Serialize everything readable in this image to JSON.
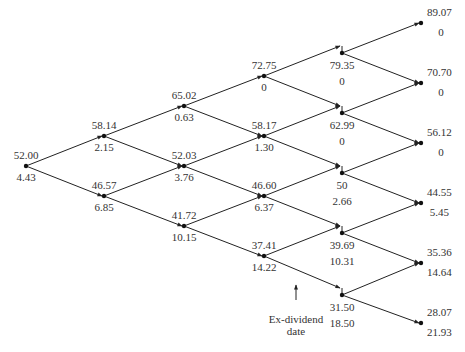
{
  "diagram": {
    "type": "binomial-tree",
    "annotation": {
      "line1": "Ex-dividend",
      "line2": "date"
    },
    "nodes": [
      {
        "id": "A",
        "step": 0,
        "x": 26,
        "y": 166,
        "price": "52.00",
        "option": "4.43"
      },
      {
        "id": "B1",
        "step": 1,
        "x": 104,
        "y": 136,
        "price": "58.14",
        "option": "2.15"
      },
      {
        "id": "B2",
        "step": 1,
        "x": 104,
        "y": 196,
        "price": "46.57",
        "option": "6.85"
      },
      {
        "id": "C1",
        "step": 2,
        "x": 184,
        "y": 106,
        "price": "65.02",
        "option": "0.63"
      },
      {
        "id": "C2",
        "step": 2,
        "x": 184,
        "y": 166,
        "price": "52.03",
        "option": "3.76"
      },
      {
        "id": "C3",
        "step": 2,
        "x": 184,
        "y": 226,
        "price": "41.72",
        "option": "10.15"
      },
      {
        "id": "D1",
        "step": 3,
        "x": 264,
        "y": 76,
        "price": "72.75",
        "option": "0"
      },
      {
        "id": "D2",
        "step": 3,
        "x": 264,
        "y": 136,
        "price": "58.17",
        "option": "1.30"
      },
      {
        "id": "D3",
        "step": 3,
        "x": 264,
        "y": 196,
        "price": "46.60",
        "option": "6.37"
      },
      {
        "id": "D4",
        "step": 3,
        "x": 264,
        "y": 256,
        "price": "37.41",
        "option": "14.22"
      },
      {
        "id": "E1",
        "step": 4,
        "x": 342,
        "y": 53,
        "price": "79.35",
        "option": "0"
      },
      {
        "id": "E2",
        "step": 4,
        "x": 342,
        "y": 113,
        "price": "62.99",
        "option": "0"
      },
      {
        "id": "E3",
        "step": 4,
        "x": 342,
        "y": 173,
        "price": "50",
        "option": "2.66"
      },
      {
        "id": "E4",
        "step": 4,
        "x": 342,
        "y": 233,
        "price": "39.69",
        "option": "10.31"
      },
      {
        "id": "E5",
        "step": 4,
        "x": 342,
        "y": 295,
        "price": "31.50",
        "option": "18.50"
      },
      {
        "id": "F1",
        "step": 5,
        "x": 421,
        "y": 23,
        "price": "89.07",
        "option": "0"
      },
      {
        "id": "F2",
        "step": 5,
        "x": 421,
        "y": 83,
        "price": "70.70",
        "option": "0"
      },
      {
        "id": "F3",
        "step": 5,
        "x": 421,
        "y": 143,
        "price": "56.12",
        "option": "0"
      },
      {
        "id": "F4",
        "step": 5,
        "x": 421,
        "y": 203,
        "price": "44.55",
        "option": "5.45"
      },
      {
        "id": "F5",
        "step": 5,
        "x": 421,
        "y": 263,
        "price": "35.36",
        "option": "14.64"
      },
      {
        "id": "F6",
        "step": 5,
        "x": 421,
        "y": 323,
        "price": "28.07",
        "option": "21.93"
      }
    ]
  }
}
